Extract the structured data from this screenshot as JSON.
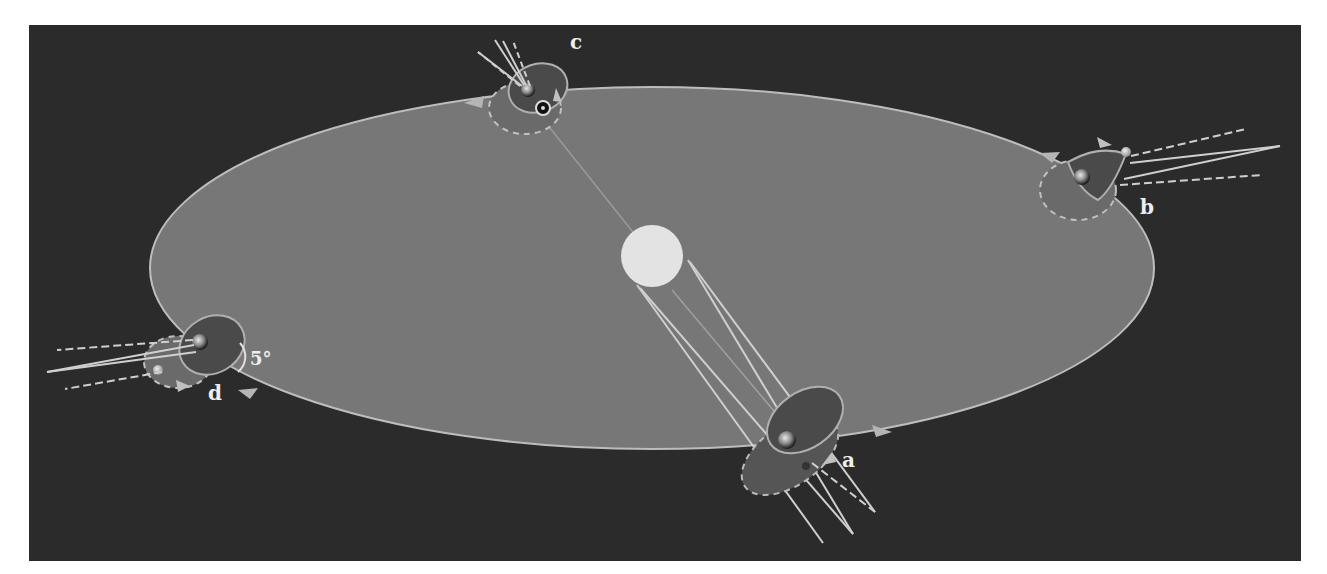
{
  "diagram": {
    "colors": {
      "background": "#ffffff",
      "space": "#2b2b2b",
      "ecliptic_plane": "#777777",
      "ecliptic_edge": "#bdbdbd",
      "moon_orbit_plane": "#4d4d4d",
      "moon_orbit_edge": "#aaaaaa",
      "sun": "#e3e3e3",
      "ray": "#cfcfcf",
      "label": "#eeeeee"
    },
    "sun": {
      "label": "Sun",
      "cx": 652,
      "cy": 256,
      "r": 31
    },
    "ecliptic": {
      "cx": 652,
      "cy": 268,
      "rx": 502,
      "ry": 181
    },
    "positions": [
      {
        "id": "a",
        "label": "a",
        "label_x": 842,
        "label_y": 467
      },
      {
        "id": "b",
        "label": "b",
        "label_x": 1140,
        "label_y": 214
      },
      {
        "id": "c",
        "label": "c",
        "label_x": 577,
        "label_y": 48
      },
      {
        "id": "d",
        "label": "d",
        "label_x": 214,
        "label_y": 399
      }
    ],
    "inclination": {
      "label": "5°",
      "x": 250,
      "y": 362
    },
    "sun_symbol": "⊙"
  }
}
